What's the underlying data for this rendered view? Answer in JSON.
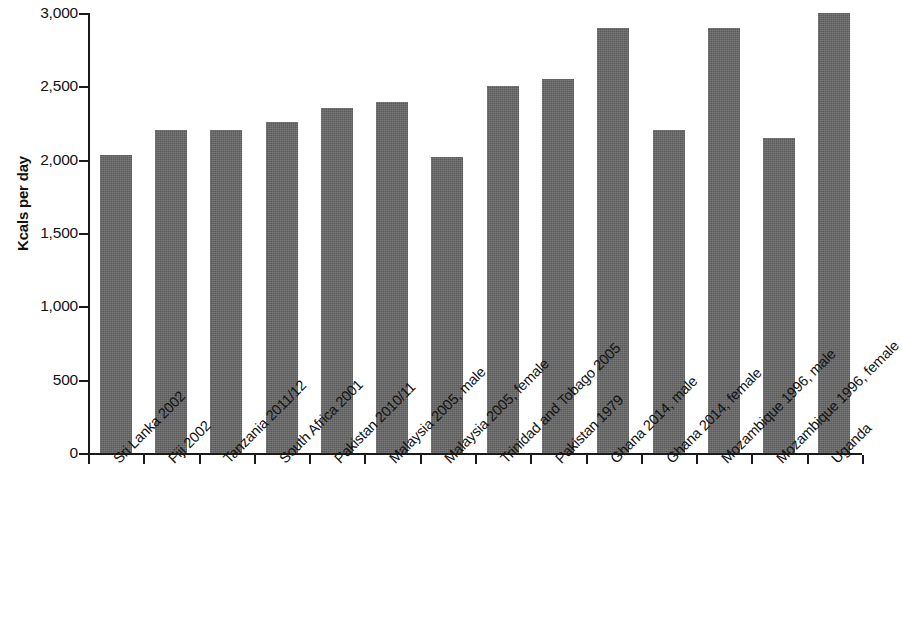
{
  "chart_data": {
    "type": "bar",
    "title": "",
    "subtitle": "",
    "xlabel": "",
    "ylabel": "Kcals per day",
    "ylim": [
      0,
      3000
    ],
    "y_ticks": [
      0,
      500,
      1000,
      1500,
      2000,
      2500,
      3000
    ],
    "y_tick_labels": [
      "0",
      "500",
      "1,000",
      "1,500",
      "2,000",
      "2,500",
      "3,000"
    ],
    "grid": false,
    "legend": "none",
    "bar_color": "#666666",
    "axis_color": "#1a1a1a",
    "categories": [
      "Sri Lanka 2002",
      "Fiji 2002",
      "Tanzania 2011/12",
      "South Africa 2001",
      "Pakistan 2010/11",
      "Malaysia 2005, male",
      "Malaysia 2005, female",
      "Trinidad and Tobago 2005",
      "Pakistan 1979",
      "Ghana 2014, male",
      "Ghana 2014, female",
      "Mozambique 1996, male",
      "Mozambique 1996, female",
      "Uganda"
    ],
    "values": [
      2030,
      2200,
      2200,
      2260,
      2350,
      2390,
      2020,
      2500,
      2550,
      2900,
      2200,
      2900,
      2150,
      3000
    ]
  }
}
